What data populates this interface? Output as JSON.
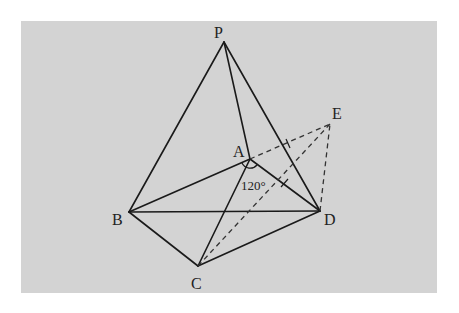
{
  "diagram": {
    "type": "geometry",
    "background_color": "#d3d3d3",
    "line_color": "#1a1a1a",
    "points": {
      "P": {
        "label": "P",
        "x": 224,
        "y": 42,
        "lx": 219,
        "ly": 38
      },
      "A": {
        "label": "A",
        "x": 250,
        "y": 159,
        "lx": 233,
        "ly": 157
      },
      "B": {
        "label": "B",
        "x": 129,
        "y": 212,
        "lx": 113,
        "ly": 226
      },
      "C": {
        "label": "C",
        "x": 198,
        "y": 266,
        "lx": 191,
        "ly": 289
      },
      "D": {
        "label": "D",
        "x": 320,
        "y": 211,
        "lx": 323,
        "ly": 226
      },
      "E": {
        "label": "E",
        "x": 330,
        "y": 124,
        "lx": 332,
        "ly": 119
      }
    },
    "solid_edges": [
      [
        "P",
        "B"
      ],
      [
        "P",
        "A"
      ],
      [
        "P",
        "D"
      ],
      [
        "A",
        "B"
      ],
      [
        "A",
        "D"
      ],
      [
        "A",
        "C"
      ],
      [
        "B",
        "D"
      ],
      [
        "B",
        "C"
      ],
      [
        "C",
        "D"
      ]
    ],
    "dashed_edges": [
      [
        "A",
        "E"
      ],
      [
        "C",
        "E"
      ],
      [
        "D",
        "E"
      ]
    ],
    "angle_label": "120°",
    "angle_vertex": "A"
  }
}
